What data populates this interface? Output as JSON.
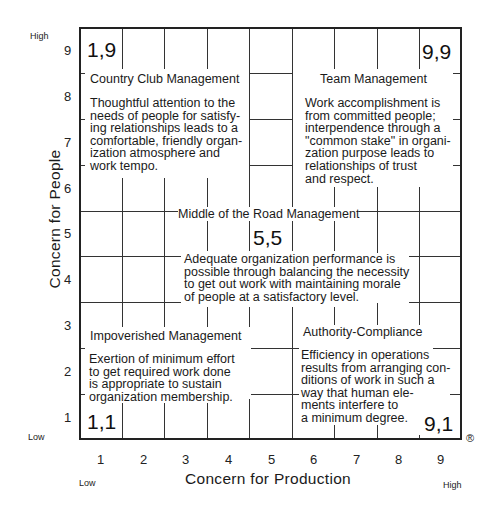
{
  "diagram": {
    "type": "managerial-grid",
    "y_axis": {
      "label": "Concern for People",
      "ticks": [
        "1",
        "2",
        "3",
        "4",
        "5",
        "6",
        "7",
        "8",
        "9"
      ],
      "low_label": "Low",
      "high_label": "High"
    },
    "x_axis": {
      "label": "Concern for Production",
      "ticks": [
        "1",
        "2",
        "3",
        "4",
        "5",
        "6",
        "7",
        "8",
        "9"
      ],
      "low_label": "Low",
      "high_label": "High"
    },
    "registered_mark": "®",
    "styles": [
      {
        "coord": "1,9",
        "title": "Country Club Management",
        "description": "Thoughtful attention to the\nneeds of people for satisfy-\ning relationships leads to a\ncomfortable, friendly organ-\nization atmosphere and\nwork tempo."
      },
      {
        "coord": "9,9",
        "title": "Team Management",
        "description": "Work accomplishment is\nfrom committed people;\ninterpendence through a\n\"common stake\" in organi-\nzation purpose leads to\nrelationships of trust\nand respect."
      },
      {
        "coord": "5,5",
        "title": "Middle of the Road Management",
        "description": "Adequate organization performance is\npossible through balancing the necessity\nto get out work with maintaining morale\nof people at a satisfactory level."
      },
      {
        "coord": "1,1",
        "title": "Impoverished Management",
        "description": "Exertion of minimum effort\nto get required work done\nis appropriate to sustain\norganization membership."
      },
      {
        "coord": "9,1",
        "title": "Authority-Compliance",
        "description": "Efficiency in operations\nresults from arranging con-\nditions of work in such a\nway that human ele-\nments interfere to\na minimum degree."
      }
    ]
  }
}
